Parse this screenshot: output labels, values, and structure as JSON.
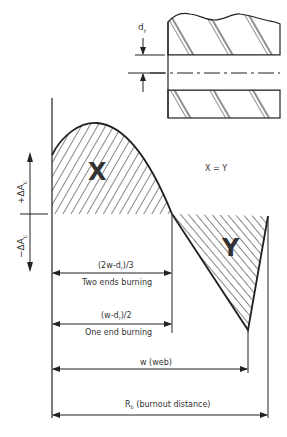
{
  "diagram": {
    "type": "burn-area-vs-distance",
    "grain_detail": {
      "perforation_label": "d",
      "perforation_subscript": "r"
    },
    "axis": {
      "positive_label": "+ΔA",
      "positive_subscript": "c",
      "negative_label": "−ΔA",
      "negative_subscript": "c"
    },
    "regions": {
      "x_label": "X",
      "y_label": "Y",
      "equality": "X = Y"
    },
    "dimensions": [
      {
        "formula": "(2w-d",
        "sub": "r",
        "tail": ")/3",
        "caption": "Two ends burning"
      },
      {
        "formula": "(w-d",
        "sub": "r",
        "tail": ")/2",
        "caption": "One end burning"
      },
      {
        "formula": "w (web)"
      },
      {
        "formula": "R",
        "sub": "b",
        "tail": " (burnout distance)"
      }
    ],
    "colors": {
      "line": "#222222",
      "background": "#ffffff"
    }
  }
}
